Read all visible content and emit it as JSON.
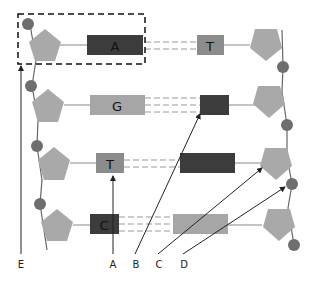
{
  "colors": {
    "sugar": "#a9a9a9",
    "phosphate": "#6e6e6e",
    "dark_base": "#3c3c3c",
    "mid_base": "#8c8c8c",
    "light_base": "#a6a6a6",
    "line": "#555555",
    "arrow": "#222222",
    "box": "#111111"
  },
  "base_pairs": [
    {
      "left_base": "A",
      "right_base": "T",
      "left_shade": "dark",
      "right_shade": "mid",
      "hydrogen_bonds": 2
    },
    {
      "left_base": "G",
      "right_base": "",
      "left_shade": "light",
      "right_shade": "dark",
      "hydrogen_bonds": 3
    },
    {
      "left_base": "T",
      "right_base": "",
      "left_shade": "mid",
      "right_shade": "dark",
      "hydrogen_bonds": 2
    },
    {
      "left_base": "C",
      "right_base": "",
      "left_shade": "dark",
      "right_shade": "light",
      "hydrogen_bonds": 3
    }
  ],
  "pointer_labels": {
    "E": "E",
    "A": "A",
    "B": "B",
    "C": "C",
    "D": "D"
  },
  "highlight_box": "dashed box around top-left nucleotide (phosphate + sugar + base A)"
}
